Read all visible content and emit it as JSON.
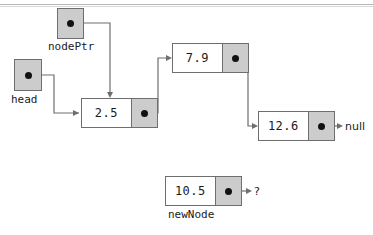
{
  "diagram": {
    "colors": {
      "pointer_cell_fill": "#cccccc",
      "box_border": "#6e6e6e",
      "wire": "#6e6e6e",
      "dot": "#111111",
      "background": "#ffffff"
    }
  },
  "pointers": [
    {
      "id": "head",
      "label": "head"
    },
    {
      "id": "nodePtr",
      "label": "nodePtr"
    }
  ],
  "nodes": [
    {
      "id": "node1",
      "value": "2.5",
      "next": "node2"
    },
    {
      "id": "node2",
      "value": "7.9",
      "next": "node3"
    },
    {
      "id": "node3",
      "value": "12.6",
      "next": "null"
    },
    {
      "id": "node4",
      "value": "10.5",
      "next": "?",
      "label": "newNode"
    }
  ],
  "terminators": {
    "null_label": "null",
    "unknown_label": "?"
  }
}
